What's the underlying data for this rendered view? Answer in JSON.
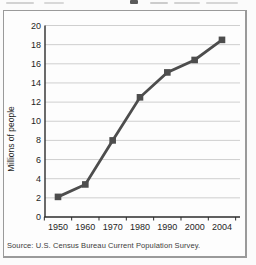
{
  "chart_data": {
    "type": "line",
    "categories": [
      "1950",
      "1960",
      "1970",
      "1980",
      "1990",
      "2000",
      "2004"
    ],
    "values": [
      2.1,
      3.4,
      8.0,
      12.5,
      15.1,
      16.4,
      18.5
    ],
    "ylabel": "Millions of people",
    "xlabel": "",
    "ylim": [
      0,
      20
    ],
    "ytick_step": 2,
    "yticks": [
      "0",
      "2",
      "4",
      "6",
      "8",
      "10",
      "12",
      "14",
      "16",
      "18",
      "20"
    ],
    "grid": "horizontal",
    "legend": "none",
    "marker": "square",
    "source": "Source: U.S. Census Bureau Current Population Survey.",
    "colors": {
      "line": "#4d4d4d",
      "marker": "#4d4d4d",
      "grid": "#cfcfcf",
      "axis": "#2b2b2b",
      "text": "#1f1f1f",
      "box_border": "#9a9a9a"
    }
  }
}
